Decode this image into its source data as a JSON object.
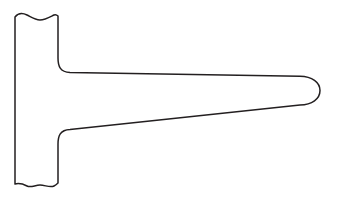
{
  "document": {
    "title": "Technical Line Drawing",
    "type": "engineering-profile-outline",
    "description": "Tee-shaped bracket cross-section profile with tapered horizontal arm"
  },
  "canvas": {
    "width": 339,
    "height": 202,
    "background_color": "#ffffff"
  },
  "drawing": {
    "stroke_color": "#231f20",
    "fill_color": "#ffffff",
    "stroke_width": 1.5,
    "shape_name": "tee-bracket-profile",
    "parts": [
      {
        "name": "vertical-flange",
        "left_x": 15,
        "right_x": 58,
        "top_y": 15,
        "bottom_y": 186
      },
      {
        "name": "tapered-horizontal-arm",
        "root_x": 58,
        "tip_x": 320,
        "root_top_y": 72,
        "root_bottom_y": 130,
        "tip_top_y": 77,
        "tip_bottom_y": 105
      },
      {
        "name": "upper-fillet",
        "radius": 14
      },
      {
        "name": "lower-fillet",
        "radius": 14
      },
      {
        "name": "rounded-tip-cap",
        "radius": 14
      },
      {
        "name": "top-break-line",
        "style": "wavy",
        "y": 17
      },
      {
        "name": "bottom-break-line",
        "style": "wavy",
        "y": 184
      }
    ],
    "path_d": "M 15 17 C 19 12 23 13 27 15 C 31 17 35 20 40 20 C 45 20 50 17 54 15 C 56 14 57 15 58 16 L 58 58 C 58 66 60 72 70 72.4 L 300 76.2 C 312 76.5 320 82 320 90.5 C 320 99 312 104.6 300 104.9 L 70 129.4 C 60 129.8 58 136 58 144 L 58 183 C 57 184 56 185 54 186 C 50 188 45 185 40 185 C 35 185 31 188 27 186 C 23 184 19 183 15 184 Z"
  }
}
